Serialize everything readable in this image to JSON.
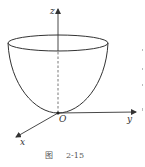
{
  "figure": {
    "axes": {
      "z_label": "z",
      "y_label": "y",
      "x_label": "x",
      "origin_label": "O"
    },
    "caption": {
      "prefix": "图",
      "number": "2-15"
    },
    "shape": "paraboloid-bowl",
    "colors": {
      "stroke": "#333333",
      "background": "#ffffff"
    }
  }
}
